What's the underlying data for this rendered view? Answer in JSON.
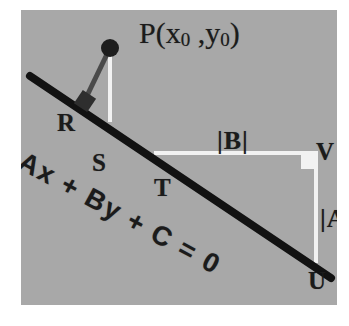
{
  "figure": {
    "kind": "geometry-diagram",
    "background_color": "#ffffff",
    "panel_color": "#a8a8a8",
    "line_color": "#121212",
    "white_color": "#f2f2f2",
    "connector_color": "#4a4a4a"
  },
  "labels": {
    "point_P": "P(x",
    "point_P_sub1": "0",
    "point_P_mid": " ,y",
    "point_P_sub2": "0",
    "point_P_end": ")",
    "point_R": "R",
    "point_S": "S",
    "point_T": "T",
    "point_U": "U",
    "point_V": "V",
    "abs_B": "|B|",
    "abs_A": "|A|",
    "equation": "Ax + By + C = 0"
  },
  "geometry": {
    "line_start": [
      10,
      67
    ],
    "line_end": [
      309,
      267
    ],
    "point_P": [
      89,
      38
    ],
    "foot_R": [
      64,
      90
    ],
    "point_S": [
      88,
      108
    ],
    "point_T": [
      133,
      138
    ],
    "point_U": [
      295,
      249
    ],
    "point_V": [
      295,
      143
    ],
    "dot_radius": 9,
    "right_angle_marker_R": [
      64,
      90
    ],
    "right_angle_marker_V": [
      295,
      143
    ]
  }
}
